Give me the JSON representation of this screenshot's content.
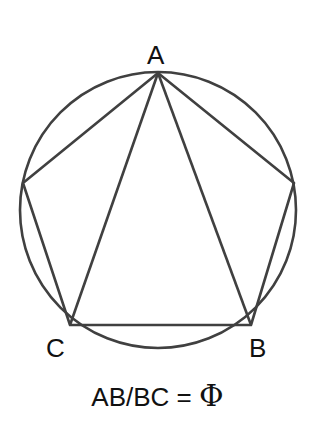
{
  "diagram": {
    "stroke_color": "#404040",
    "circle": {
      "cx": 158,
      "cy": 210,
      "r": 138
    },
    "vertices": {
      "A": [
        158,
        73
      ],
      "right": [
        294,
        183
      ],
      "B": [
        251,
        325
      ],
      "C": [
        70,
        325
      ],
      "left": [
        23,
        183
      ]
    },
    "labels": {
      "A": "A",
      "B": "B",
      "C": "C"
    }
  },
  "caption": {
    "lhs": "AB/BC = ",
    "phi": "Φ"
  }
}
